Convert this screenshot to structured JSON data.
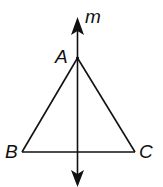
{
  "diagram": {
    "type": "geometry",
    "line": {
      "label": "m",
      "arrows": "both ends"
    },
    "points": {
      "A": {
        "label": "A"
      },
      "B": {
        "label": "B"
      },
      "C": {
        "label": "C"
      }
    },
    "segments": [
      "AB",
      "AC",
      "BC"
    ],
    "colors": {
      "stroke": "#111111",
      "background": "#ffffff"
    }
  }
}
